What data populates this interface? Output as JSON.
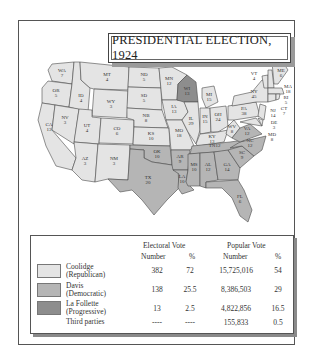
{
  "title": "PRESIDENTIAL ELECTION, 1924",
  "colors": {
    "republican": "#e4e4e4",
    "democratic": "#b5b5b5",
    "progressive": "#8d8d8d"
  },
  "states": [
    {
      "abbr": "WA",
      "ev": "7",
      "party": "republican"
    },
    {
      "abbr": "OR",
      "ev": "5",
      "party": "republican"
    },
    {
      "abbr": "CA",
      "ev": "13",
      "party": "republican"
    },
    {
      "abbr": "ID",
      "ev": "4",
      "party": "republican"
    },
    {
      "abbr": "NV",
      "ev": "3",
      "party": "republican"
    },
    {
      "abbr": "MT",
      "ev": "4",
      "party": "republican"
    },
    {
      "abbr": "WY",
      "ev": "3",
      "party": "republican"
    },
    {
      "abbr": "UT",
      "ev": "4",
      "party": "republican"
    },
    {
      "abbr": "AZ",
      "ev": "3",
      "party": "republican"
    },
    {
      "abbr": "CO",
      "ev": "6",
      "party": "republican"
    },
    {
      "abbr": "NM",
      "ev": "3",
      "party": "republican"
    },
    {
      "abbr": "ND",
      "ev": "5",
      "party": "republican"
    },
    {
      "abbr": "SD",
      "ev": "5",
      "party": "republican"
    },
    {
      "abbr": "NB",
      "ev": "8",
      "party": "republican"
    },
    {
      "abbr": "KS",
      "ev": "10",
      "party": "republican"
    },
    {
      "abbr": "OK",
      "ev": "10",
      "party": "democratic"
    },
    {
      "abbr": "TX",
      "ev": "20",
      "party": "democratic"
    },
    {
      "abbr": "MN",
      "ev": "12",
      "party": "republican"
    },
    {
      "abbr": "IA",
      "ev": "13",
      "party": "republican"
    },
    {
      "abbr": "MO",
      "ev": "18",
      "party": "republican"
    },
    {
      "abbr": "AR",
      "ev": "9",
      "party": "democratic"
    },
    {
      "abbr": "LA",
      "ev": "10",
      "party": "democratic"
    },
    {
      "abbr": "WI",
      "ev": "13",
      "party": "progressive"
    },
    {
      "abbr": "IL",
      "ev": "29",
      "party": "republican"
    },
    {
      "abbr": "MI",
      "ev": "15",
      "party": "republican"
    },
    {
      "abbr": "IN",
      "ev": "15",
      "party": "republican"
    },
    {
      "abbr": "OH",
      "ev": "24",
      "party": "republican"
    },
    {
      "abbr": "KY",
      "ev": "13",
      "party": "republican"
    },
    {
      "abbr": "TN",
      "ev": "12",
      "party": "democratic"
    },
    {
      "abbr": "MS",
      "ev": "10",
      "party": "democratic"
    },
    {
      "abbr": "AL",
      "ev": "12",
      "party": "democratic"
    },
    {
      "abbr": "GA",
      "ev": "14",
      "party": "democratic"
    },
    {
      "abbr": "FL",
      "ev": "6",
      "party": "democratic"
    },
    {
      "abbr": "SC",
      "ev": "9",
      "party": "democratic"
    },
    {
      "abbr": "NC",
      "ev": "12",
      "party": "democratic"
    },
    {
      "abbr": "VA",
      "ev": "12",
      "party": "democratic"
    },
    {
      "abbr": "WV",
      "ev": "8",
      "party": "republican"
    },
    {
      "abbr": "PA",
      "ev": "38",
      "party": "republican"
    },
    {
      "abbr": "NY",
      "ev": "45",
      "party": "republican"
    },
    {
      "abbr": "VT",
      "ev": "4",
      "party": "republican"
    },
    {
      "abbr": "NH",
      "ev": "4",
      "party": "republican"
    },
    {
      "abbr": "ME",
      "ev": "6",
      "party": "republican"
    },
    {
      "abbr": "MA",
      "ev": "18",
      "party": "republican"
    },
    {
      "abbr": "RI",
      "ev": "5",
      "party": "republican"
    },
    {
      "abbr": "CT",
      "ev": "7",
      "party": "republican"
    },
    {
      "abbr": "NJ",
      "ev": "14",
      "party": "republican"
    },
    {
      "abbr": "DE",
      "ev": "3",
      "party": "republican"
    },
    {
      "abbr": "MD",
      "ev": "8",
      "party": "republican"
    }
  ],
  "legend": {
    "electoral_header": "Electoral Vote",
    "popular_header": "Popular Vote",
    "number_label": "Number",
    "pct_label": "%",
    "rows": [
      {
        "name1": "Coolidge",
        "name2": "(Republican)",
        "ev": "382",
        "ev_pct": "72",
        "pv": "15,725,016",
        "pv_pct": "54"
      },
      {
        "name1": "Davis",
        "name2": "(Democratic)",
        "ev": "138",
        "ev_pct": "25.5",
        "pv": "8,386,503",
        "pv_pct": "29"
      },
      {
        "name1": "La Follette",
        "name2": "(Progressive)",
        "ev": "13",
        "ev_pct": "2.5",
        "pv": "4,822,856",
        "pv_pct": "16.5"
      },
      {
        "name1": "Third parties",
        "name2": "",
        "ev": "----",
        "ev_pct": "----",
        "pv": "155,833",
        "pv_pct": "0.5"
      }
    ]
  }
}
